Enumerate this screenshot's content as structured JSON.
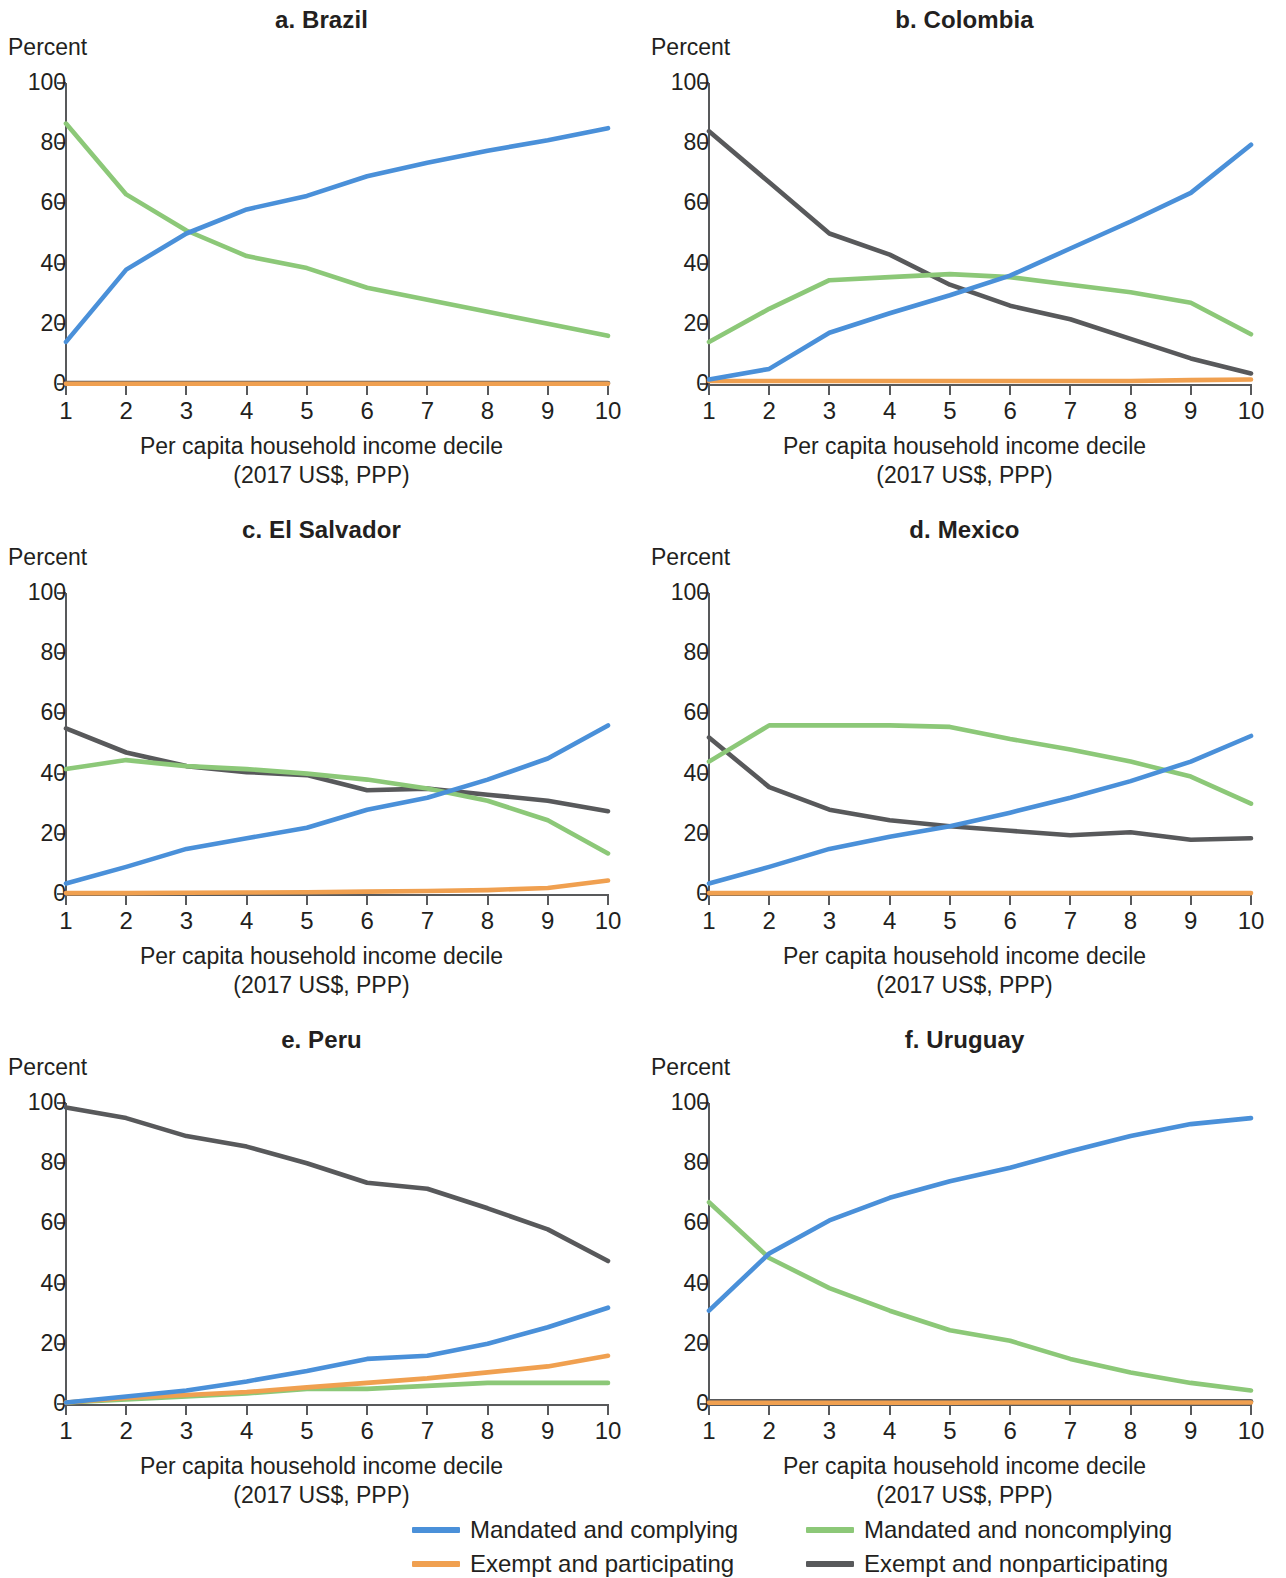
{
  "figure": {
    "y_axis_label": "Percent",
    "x_axis_caption_line1": "Per capita household income decile",
    "x_axis_caption_line2": "(2017 US$, PPP)",
    "y_ticks": [
      "0",
      "20",
      "40",
      "60",
      "80",
      "100"
    ],
    "x_ticks": [
      "1",
      "2",
      "3",
      "4",
      "5",
      "6",
      "7",
      "8",
      "9",
      "10"
    ]
  },
  "legend": {
    "items": [
      {
        "label": "Mandated and complying",
        "color": "#4a90d9"
      },
      {
        "label": "Mandated and noncomplying",
        "color": "#8cc878"
      },
      {
        "label": "Exempt and participating",
        "color": "#f0a050"
      },
      {
        "label": "Exempt and nonparticipating",
        "color": "#58595b"
      }
    ]
  },
  "panels": [
    {
      "title": "a. Brazil"
    },
    {
      "title": "b. Colombia"
    },
    {
      "title": "c. El Salvador"
    },
    {
      "title": "d. Mexico"
    },
    {
      "title": "e. Peru"
    },
    {
      "title": "f. Uruguay"
    }
  ],
  "chart_data": [
    {
      "type": "line",
      "title": "a. Brazil",
      "xlabel": "Per capita household income decile (2017 US$, PPP)",
      "ylabel": "Percent",
      "x": [
        1,
        2,
        3,
        4,
        5,
        6,
        7,
        8,
        9,
        10
      ],
      "xlim": [
        1,
        10
      ],
      "ylim": [
        0,
        100
      ],
      "grid": false,
      "legend_position": "bottom",
      "series": [
        {
          "name": "Mandated and complying",
          "color": "#4a90d9",
          "values": [
            14,
            38,
            50,
            58,
            62.5,
            69,
            73.5,
            77.5,
            81,
            85
          ]
        },
        {
          "name": "Mandated and noncomplying",
          "color": "#8cc878",
          "values": [
            86.5,
            63,
            51,
            42.5,
            38.5,
            32,
            28,
            24,
            20,
            16
          ]
        },
        {
          "name": "Exempt and participating",
          "color": "#f0a050",
          "values": [
            0.1,
            0.1,
            0.1,
            0.1,
            0.1,
            0.1,
            0.1,
            0.1,
            0.1,
            0.1
          ]
        },
        {
          "name": "Exempt and nonparticipating",
          "color": "#58595b",
          "values": [
            0.3,
            0.3,
            0.3,
            0.3,
            0.3,
            0.3,
            0.3,
            0.3,
            0.3,
            0.3
          ]
        }
      ]
    },
    {
      "type": "line",
      "title": "b. Colombia",
      "xlabel": "Per capita household income decile (2017 US$, PPP)",
      "ylabel": "Percent",
      "x": [
        1,
        2,
        3,
        4,
        5,
        6,
        7,
        8,
        9,
        10
      ],
      "xlim": [
        1,
        10
      ],
      "ylim": [
        0,
        100
      ],
      "grid": false,
      "legend_position": "bottom",
      "series": [
        {
          "name": "Mandated and complying",
          "color": "#4a90d9",
          "values": [
            1.5,
            5,
            17,
            23.5,
            29.5,
            36,
            45,
            54,
            63.5,
            79.5
          ]
        },
        {
          "name": "Mandated and noncomplying",
          "color": "#8cc878",
          "values": [
            14,
            25,
            34.5,
            35.5,
            36.5,
            35.5,
            33,
            30.5,
            27,
            16.5
          ]
        },
        {
          "name": "Exempt and participating",
          "color": "#f0a050",
          "values": [
            1,
            1,
            1,
            1,
            1,
            1,
            1,
            1,
            1.3,
            1.5
          ]
        },
        {
          "name": "Exempt and nonparticipating",
          "color": "#58595b",
          "values": [
            84,
            67,
            50,
            43,
            33,
            26,
            21.5,
            15,
            8.5,
            3.5
          ]
        }
      ]
    },
    {
      "type": "line",
      "title": "c. El Salvador",
      "xlabel": "Per capita household income decile (2017 US$, PPP)",
      "ylabel": "Percent",
      "x": [
        1,
        2,
        3,
        4,
        5,
        6,
        7,
        8,
        9,
        10
      ],
      "xlim": [
        1,
        10
      ],
      "ylim": [
        0,
        100
      ],
      "grid": false,
      "legend_position": "bottom",
      "series": [
        {
          "name": "Mandated and complying",
          "color": "#4a90d9",
          "values": [
            3.5,
            9,
            15,
            18.5,
            22,
            28,
            32,
            38,
            45,
            56
          ]
        },
        {
          "name": "Mandated and noncomplying",
          "color": "#8cc878",
          "values": [
            41.5,
            44.5,
            42.5,
            41.5,
            40,
            38,
            35,
            31,
            24.5,
            13.5
          ]
        },
        {
          "name": "Exempt and participating",
          "color": "#f0a050",
          "values": [
            0.3,
            0.3,
            0.4,
            0.5,
            0.6,
            0.8,
            1,
            1.3,
            2,
            4.5
          ]
        },
        {
          "name": "Exempt and nonparticipating",
          "color": "#58595b",
          "values": [
            55,
            47,
            42.5,
            40.5,
            39.5,
            34.5,
            35,
            33,
            31,
            27.5
          ]
        }
      ]
    },
    {
      "type": "line",
      "title": "d. Mexico",
      "xlabel": "Per capita household income decile (2017 US$, PPP)",
      "ylabel": "Percent",
      "x": [
        1,
        2,
        3,
        4,
        5,
        6,
        7,
        8,
        9,
        10
      ],
      "xlim": [
        1,
        10
      ],
      "ylim": [
        0,
        100
      ],
      "grid": false,
      "legend_position": "bottom",
      "series": [
        {
          "name": "Mandated and complying",
          "color": "#4a90d9",
          "values": [
            3.5,
            9,
            15,
            19,
            22.5,
            27,
            32,
            37.5,
            44,
            52.5
          ]
        },
        {
          "name": "Mandated and noncomplying",
          "color": "#8cc878",
          "values": [
            44,
            56,
            56,
            56,
            55.5,
            51.5,
            48,
            44,
            39,
            30
          ]
        },
        {
          "name": "Exempt and participating",
          "color": "#f0a050",
          "values": [
            0.3,
            0.3,
            0.3,
            0.3,
            0.3,
            0.3,
            0.3,
            0.3,
            0.3,
            0.3
          ]
        },
        {
          "name": "Exempt and nonparticipating",
          "color": "#58595b",
          "values": [
            52,
            35.5,
            28,
            24.5,
            22.5,
            21,
            19.5,
            20.5,
            18,
            18.5
          ]
        }
      ]
    },
    {
      "type": "line",
      "title": "e. Peru",
      "xlabel": "Per capita household income decile (2017 US$, PPP)",
      "ylabel": "Percent",
      "x": [
        1,
        2,
        3,
        4,
        5,
        6,
        7,
        8,
        9,
        10
      ],
      "xlim": [
        1,
        10
      ],
      "ylim": [
        0,
        100
      ],
      "grid": false,
      "legend_position": "bottom",
      "series": [
        {
          "name": "Mandated and complying",
          "color": "#4a90d9",
          "values": [
            0.5,
            2.5,
            4.5,
            7.5,
            11,
            15,
            16,
            20,
            25.5,
            32
          ]
        },
        {
          "name": "Mandated and noncomplying",
          "color": "#8cc878",
          "values": [
            0.5,
            1.5,
            2.5,
            3.5,
            5,
            5,
            6,
            7,
            7,
            7
          ]
        },
        {
          "name": "Exempt and participating",
          "color": "#f0a050",
          "values": [
            0.5,
            2,
            3,
            4,
            5.5,
            7,
            8.5,
            10.5,
            12.5,
            16
          ]
        },
        {
          "name": "Exempt and nonparticipating",
          "color": "#58595b",
          "values": [
            98.5,
            95,
            89,
            85.5,
            80,
            73.5,
            71.5,
            65,
            58,
            47.5
          ]
        }
      ]
    },
    {
      "type": "line",
      "title": "f. Uruguay",
      "xlabel": "Per capita household income decile (2017 US$, PPP)",
      "ylabel": "Percent",
      "x": [
        1,
        2,
        3,
        4,
        5,
        6,
        7,
        8,
        9,
        10
      ],
      "xlim": [
        1,
        10
      ],
      "ylim": [
        0,
        100
      ],
      "grid": false,
      "legend_position": "bottom",
      "series": [
        {
          "name": "Mandated and complying",
          "color": "#4a90d9",
          "values": [
            31,
            50,
            61,
            68.5,
            74,
            78.5,
            84,
            89,
            93,
            95
          ]
        },
        {
          "name": "Mandated and noncomplying",
          "color": "#8cc878",
          "values": [
            67,
            48.5,
            38.5,
            31,
            24.5,
            21,
            15,
            10.5,
            7,
            4.5
          ]
        },
        {
          "name": "Exempt and participating",
          "color": "#f0a050",
          "values": [
            0.4,
            0.4,
            0.4,
            0.4,
            0.4,
            0.5,
            0.5,
            0.5,
            0.5,
            0.5
          ]
        },
        {
          "name": "Exempt and nonparticipating",
          "color": "#58595b",
          "values": [
            0.9,
            0.9,
            0.9,
            0.9,
            0.9,
            0.9,
            0.9,
            0.9,
            0.9,
            0.9
          ]
        }
      ]
    }
  ]
}
